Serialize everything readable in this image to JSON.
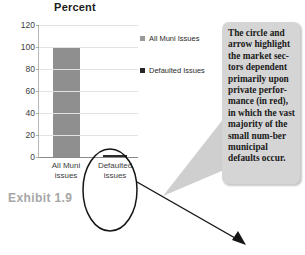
{
  "chart_data": {
    "type": "bar",
    "title": "Percent",
    "xlabel": "",
    "ylabel": "",
    "categories": [
      "All Muni issues",
      "Defaulted issues"
    ],
    "values": [
      100,
      0.4
    ],
    "series": [
      {
        "name": "All Muni Issues",
        "values": [
          100,
          null
        ],
        "color": "#8f8f8f"
      },
      {
        "name": "Defaulted Issues",
        "values": [
          null,
          0.4
        ],
        "color": "#2b2b2b"
      }
    ],
    "yticks": [
      0,
      20,
      40,
      60,
      80,
      100,
      120
    ],
    "ylim": [
      0,
      120
    ],
    "grid": true,
    "legend_position": "right"
  },
  "chart": {
    "title": "Percent",
    "yticks": [
      "120",
      "100",
      "80",
      "60",
      "40",
      "20",
      "0"
    ],
    "xcategories": [
      {
        "line1": "All Muni",
        "line2": "issues"
      },
      {
        "line1": "Defaulted",
        "line2": "issues"
      }
    ],
    "legend": [
      {
        "label": "All Muni Issues",
        "color": "#9a9a9a",
        "marker": "square-marker"
      },
      {
        "label": "Defaulted Issues",
        "color": "#262626",
        "marker": "square-marker"
      }
    ]
  },
  "exhibit": {
    "label": "Exhibit 1.9"
  },
  "callout": {
    "text": "The circle and arrow highlight the market sec-tors dependent primarily upon private perfor-mance (in red), in which the vast majority of the small num-ber municipal defaults occur."
  },
  "annotations": {
    "ellipse_name": "highlight-ellipse",
    "arrow_name": "pointer-arrow"
  },
  "colors": {
    "bar_all_muni": "#8f8f8f",
    "bar_defaulted": "#2b2b2b",
    "callout_bg": "#d5d5d5",
    "exhibit_text": "#a6a6a6",
    "grid": "#e2e2e2"
  }
}
